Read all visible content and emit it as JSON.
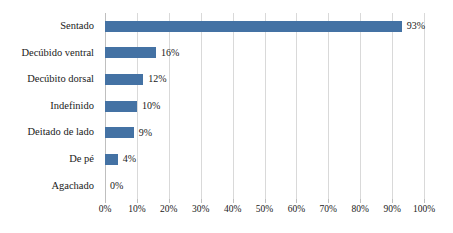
{
  "chart_data": {
    "type": "bar",
    "orientation": "horizontal",
    "title": "",
    "subtitle": "",
    "xlabel": "",
    "ylabel": "",
    "categories": [
      "Sentado",
      "Decúbido ventral",
      "Decúbito dorsal",
      "Indefinido",
      "Deitado de lado",
      "De pé",
      "Agachado"
    ],
    "values": [
      93,
      16,
      12,
      10,
      9,
      4,
      0
    ],
    "value_labels": [
      "93%",
      "16%",
      "12%",
      "10%",
      "9%",
      "4%",
      "0%"
    ],
    "xlim": [
      0,
      100
    ],
    "xticks": [
      0,
      10,
      20,
      30,
      40,
      50,
      60,
      70,
      80,
      90,
      100
    ],
    "xtick_labels": [
      "0%",
      "10%",
      "20%",
      "30%",
      "40%",
      "50%",
      "60%",
      "70%",
      "80%",
      "90%",
      "100%"
    ],
    "grid": "vertical",
    "legend": "none",
    "bar_color": "#4472a4",
    "gridline_color": "#d9d9d9",
    "axis_color": "#bfbfbf",
    "background": "#ffffff"
  }
}
